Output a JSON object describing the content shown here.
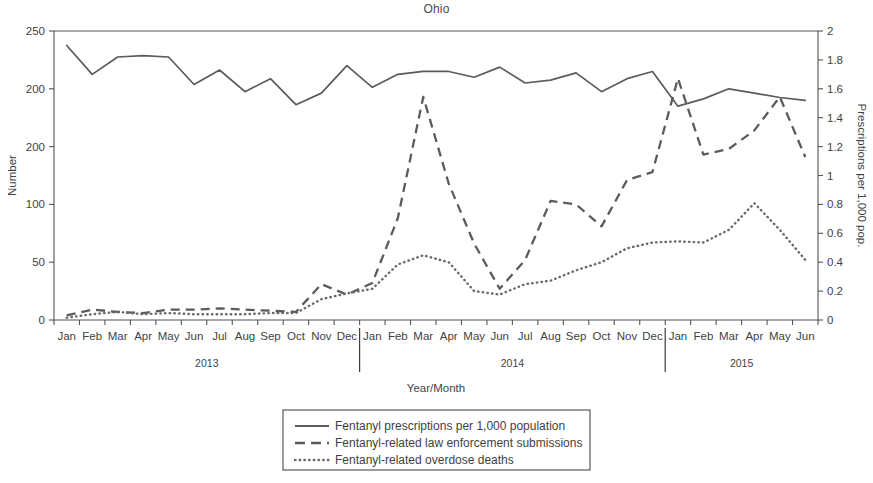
{
  "chart_data": {
    "type": "line",
    "title": "Ohio",
    "xlabel": "Year/Month",
    "ylabel": "Number",
    "y2label": "Prescriptions per 1,000 pop.",
    "ylim": [
      0,
      250
    ],
    "y2lim": [
      0,
      2
    ],
    "grid": false,
    "legend_position": "bottom-center",
    "y_ticks": [
      "0",
      "50",
      "100",
      "200",
      "200",
      "250"
    ],
    "y_tick_values": [
      0,
      50,
      100,
      150,
      200,
      250
    ],
    "y2_ticks": [
      "0",
      "0.2",
      "0.4",
      "0.6",
      "0.8",
      "1",
      "1.2",
      "1.4",
      "1.6",
      "1.8",
      "2"
    ],
    "y2_tick_values": [
      0,
      0.2,
      0.4,
      0.6,
      0.8,
      1,
      1.2,
      1.4,
      1.6,
      1.8,
      2
    ],
    "categories": [
      "Jan",
      "Feb",
      "Mar",
      "Apr",
      "May",
      "Jun",
      "Jul",
      "Aug",
      "Sep",
      "Oct",
      "Nov",
      "Dec",
      "Jan",
      "Feb",
      "Mar",
      "Apr",
      "May",
      "Jun",
      "Jul",
      "Aug",
      "Sep",
      "Oct",
      "Nov",
      "Dec",
      "Jan",
      "Feb",
      "Mar",
      "Apr",
      "May",
      "Jun"
    ],
    "year_groups": [
      {
        "label": "2013",
        "start_index": 0,
        "end_index": 11
      },
      {
        "label": "2014",
        "start_index": 12,
        "end_index": 23
      },
      {
        "label": "2015",
        "start_index": 24,
        "end_index": 29
      }
    ],
    "series": [
      {
        "name": "Fentanyl prescriptions per 1,000 population",
        "style": "solid",
        "axis": "right",
        "values": [
          1.9,
          1.7,
          1.82,
          1.83,
          1.82,
          1.63,
          1.73,
          1.58,
          1.67,
          1.49,
          1.57,
          1.76,
          1.61,
          1.7,
          1.72,
          1.72,
          1.68,
          1.75,
          1.64,
          1.66,
          1.71,
          1.58,
          1.67,
          1.72,
          1.48,
          1.53,
          1.6,
          1.57,
          1.54,
          1.52
        ]
      },
      {
        "name": "Fentanyl-related law enforcement submissions",
        "style": "dashed",
        "axis": "left",
        "values": [
          4,
          9,
          7,
          6,
          9,
          9,
          10,
          9,
          8,
          7,
          31,
          22,
          32,
          88,
          193,
          118,
          66,
          27,
          52,
          103,
          100,
          81,
          121,
          128,
          209,
          143,
          148,
          164,
          193,
          141
        ]
      },
      {
        "name": "Fentanyl-related overdose deaths",
        "style": "dotted",
        "axis": "left",
        "values": [
          2,
          5,
          7,
          5,
          6,
          5,
          5,
          5,
          6,
          6,
          18,
          23,
          27,
          48,
          56,
          50,
          25,
          22,
          31,
          34,
          43,
          50,
          62,
          67,
          68,
          67,
          78,
          101,
          78,
          52
        ]
      }
    ],
    "legend": [
      {
        "label": "Fentanyl prescriptions per 1,000 population",
        "style": "solid"
      },
      {
        "label": "Fentanyl-related law enforcement submissions",
        "style": "dashed"
      },
      {
        "label": "Fentanyl-related overdose deaths",
        "style": "dotted"
      }
    ],
    "colors": {
      "solid": "#5b5b5b",
      "dashed": "#5b5b5b",
      "dotted": "#6a6a6a",
      "axis": "#555555",
      "text": "#3f3f3f",
      "background": "#ffffff"
    }
  }
}
